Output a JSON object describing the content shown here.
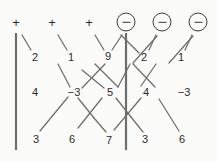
{
  "diagram": {
    "background_color": "#fbfbf9",
    "line_color": "#6e6e6e",
    "text_color": "#2b2b2b",
    "width": 217,
    "height": 161,
    "headers": [
      {
        "id": "h1",
        "symbol": "+",
        "type": "plus",
        "x": 16,
        "y": 22
      },
      {
        "id": "h2",
        "symbol": "+",
        "type": "plus",
        "x": 52,
        "y": 22
      },
      {
        "id": "h3",
        "symbol": "+",
        "type": "plus",
        "x": 89,
        "y": 22
      },
      {
        "id": "h4",
        "symbol": "−",
        "type": "circled-minus",
        "x": 126,
        "y": 22
      },
      {
        "id": "h5",
        "symbol": "−",
        "type": "circled-minus",
        "x": 162,
        "y": 22
      },
      {
        "id": "h6",
        "symbol": "−",
        "type": "circled-minus",
        "x": 198,
        "y": 22
      }
    ],
    "rows": [
      {
        "row": 1,
        "nodes": [
          {
            "id": "r1c1",
            "value": "2",
            "x": 35,
            "y": 57
          },
          {
            "id": "r1c2",
            "value": "1",
            "x": 71,
            "y": 57
          },
          {
            "id": "r1c3",
            "value": "9",
            "x": 108,
            "y": 56
          },
          {
            "id": "r1c4",
            "value": "2",
            "x": 144,
            "y": 57
          },
          {
            "id": "r1c5",
            "value": "1",
            "x": 181,
            "y": 57
          }
        ]
      },
      {
        "row": 2,
        "nodes": [
          {
            "id": "r2c1",
            "value": "4",
            "x": 35,
            "y": 92
          },
          {
            "id": "r2c2",
            "value": "−3",
            "x": 74,
            "y": 92
          },
          {
            "id": "r2c3",
            "value": "5",
            "x": 110,
            "y": 92
          },
          {
            "id": "r2c4",
            "value": "4",
            "x": 146,
            "y": 92
          },
          {
            "id": "r2c5",
            "value": "−3",
            "x": 184,
            "y": 92
          }
        ]
      },
      {
        "row": 3,
        "nodes": [
          {
            "id": "r3c1",
            "value": "3",
            "x": 36,
            "y": 139
          },
          {
            "id": "r3c2",
            "value": "6",
            "x": 72,
            "y": 139
          },
          {
            "id": "r3c3",
            "value": "7",
            "x": 109,
            "y": 140
          },
          {
            "id": "r3c4",
            "value": "3",
            "x": 145,
            "y": 139
          },
          {
            "id": "r3c5",
            "value": "6",
            "x": 182,
            "y": 139
          }
        ]
      }
    ],
    "vertical_rules": [
      {
        "id": "vrule-left",
        "x": 16,
        "y1": 33,
        "y2": 150
      },
      {
        "id": "vrule-center",
        "x": 126,
        "y1": 33,
        "y2": 150
      }
    ],
    "connectors": [
      {
        "id": "c01",
        "x1": 22,
        "y1": 35,
        "x2": 31,
        "y2": 50
      },
      {
        "id": "c02",
        "x1": 58,
        "y1": 35,
        "x2": 67,
        "y2": 50
      },
      {
        "id": "c03",
        "x1": 95,
        "y1": 35,
        "x2": 104,
        "y2": 50
      },
      {
        "id": "c04",
        "x1": 122,
        "y1": 35,
        "x2": 112,
        "y2": 50
      },
      {
        "id": "c05",
        "x1": 121,
        "y1": 35,
        "x2": 139,
        "y2": 53
      },
      {
        "id": "c06",
        "x1": 156,
        "y1": 35,
        "x2": 149,
        "y2": 50
      },
      {
        "id": "c07",
        "x1": 157,
        "y1": 36,
        "x2": 133,
        "y2": 63
      },
      {
        "id": "c08",
        "x1": 192,
        "y1": 35,
        "x2": 185,
        "y2": 50
      },
      {
        "id": "c09",
        "x1": 193,
        "y1": 36,
        "x2": 169,
        "y2": 63
      },
      {
        "id": "c10",
        "x1": 58,
        "y1": 64,
        "x2": 70,
        "y2": 87
      },
      {
        "id": "c11",
        "x1": 82,
        "y1": 70,
        "x2": 104,
        "y2": 88
      },
      {
        "id": "c12",
        "x1": 105,
        "y1": 64,
        "x2": 82,
        "y2": 88
      },
      {
        "id": "c13",
        "x1": 95,
        "y1": 64,
        "x2": 118,
        "y2": 87
      },
      {
        "id": "c14",
        "x1": 130,
        "y1": 64,
        "x2": 118,
        "y2": 87
      },
      {
        "id": "c15",
        "x1": 133,
        "y1": 64,
        "x2": 155,
        "y2": 87
      },
      {
        "id": "c16",
        "x1": 156,
        "y1": 64,
        "x2": 141,
        "y2": 86
      },
      {
        "id": "c17",
        "x1": 68,
        "y1": 97,
        "x2": 40,
        "y2": 131
      },
      {
        "id": "c18",
        "x1": 78,
        "y1": 98,
        "x2": 94,
        "y2": 118
      },
      {
        "id": "c19",
        "x1": 102,
        "y1": 98,
        "x2": 78,
        "y2": 128
      },
      {
        "id": "c20",
        "x1": 94,
        "y1": 118,
        "x2": 106,
        "y2": 132
      },
      {
        "id": "c21",
        "x1": 116,
        "y1": 98,
        "x2": 131,
        "y2": 117
      },
      {
        "id": "c22",
        "x1": 141,
        "y1": 98,
        "x2": 114,
        "y2": 130
      },
      {
        "id": "c23",
        "x1": 131,
        "y1": 117,
        "x2": 143,
        "y2": 132
      },
      {
        "id": "c24",
        "x1": 159,
        "y1": 99,
        "x2": 179,
        "y2": 131
      }
    ]
  }
}
